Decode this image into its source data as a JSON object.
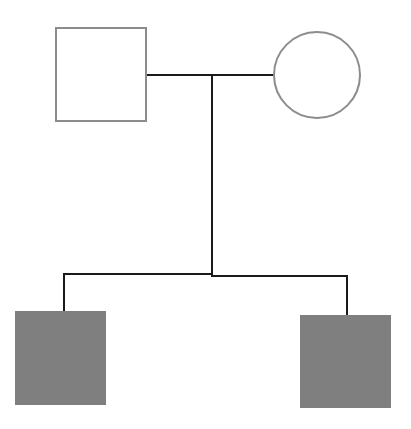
{
  "diagram": {
    "type": "pedigree",
    "colors": {
      "background": "#ffffff",
      "unaffected_fill": "#ffffff",
      "unaffected_stroke": "#8c8c8c",
      "affected_fill": "#7f7f7f",
      "line": "#1a1a1a"
    },
    "parents": {
      "father": {
        "sex": "male",
        "shape": "square",
        "affected": false
      },
      "mother": {
        "sex": "female",
        "shape": "circle",
        "affected": false
      }
    },
    "children": [
      {
        "sex": "male",
        "shape": "square",
        "affected": true
      },
      {
        "sex": "male",
        "shape": "square",
        "affected": true
      }
    ]
  }
}
